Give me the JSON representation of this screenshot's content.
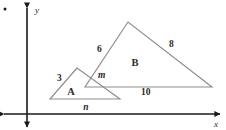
{
  "figure": {
    "name": "similar-triangles-on-coordinate-plane",
    "background_color": "#ffffff",
    "triangle_stroke_color": "#8d8d8d",
    "axis_color": "#1a1a1a",
    "label_color": "#2b2b2b"
  },
  "axes": {
    "x_label": "x",
    "y_label": "y",
    "x_arrow_both_ends": true,
    "y_arrow_both_ends": true
  },
  "triangles": [
    {
      "region_label": "A",
      "role": "small-triangle",
      "side_labels": [
        "3"
      ],
      "base_label": "n"
    },
    {
      "region_label": "B",
      "role": "large-triangle",
      "side_labels": [
        "6",
        "8"
      ],
      "base_label": "10",
      "short_side_label": "m"
    }
  ],
  "labels": {
    "three": "3",
    "six": "6",
    "eight": "8",
    "ten": "10",
    "m": "m",
    "n": "n",
    "region_a": "A",
    "region_b": "B",
    "axis_x": "x",
    "axis_y": "y"
  }
}
